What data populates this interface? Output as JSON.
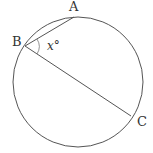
{
  "diagram": {
    "type": "circle-geometry",
    "circle": {
      "cx": 78,
      "cy": 82,
      "r": 65,
      "stroke": "#555555"
    },
    "points": [
      {
        "id": "A",
        "label": "A",
        "x": 74,
        "y": 17,
        "label_x": 69,
        "label_y": 11
      },
      {
        "id": "B",
        "label": "B",
        "x": 25,
        "y": 46,
        "label_x": 12,
        "label_y": 46
      },
      {
        "id": "C",
        "label": "C",
        "x": 131,
        "y": 116,
        "label_x": 137,
        "label_y": 126
      }
    ],
    "chords": [
      {
        "from": "B",
        "to": "A"
      },
      {
        "from": "B",
        "to": "C"
      }
    ],
    "angle": {
      "vertex": "B",
      "label": "x°",
      "label_x": 47,
      "label_y": 50
    }
  }
}
